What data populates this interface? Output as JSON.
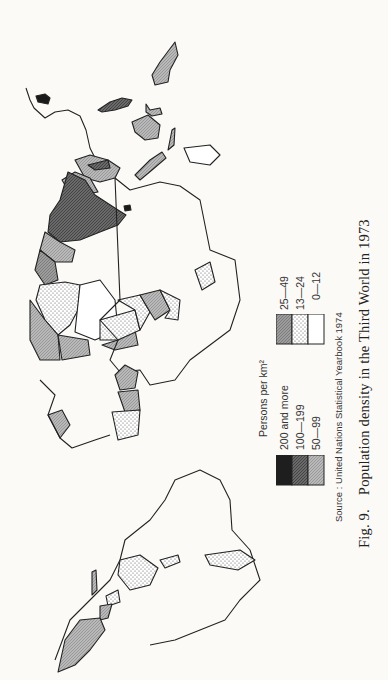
{
  "figure": {
    "number_label": "Fig. 9.",
    "title": "Population density in the Third World in 1973",
    "source": "Source : United Nations Statistical Yearbook 1974"
  },
  "legend": {
    "title": "Persons per km²",
    "items": [
      {
        "label": "200 and more",
        "pattern": "solid-black",
        "color": "#1a1a1a"
      },
      {
        "label": "100—199",
        "pattern": "dark-hatch",
        "color": "#5a5a5a"
      },
      {
        "label": "50—99",
        "pattern": "grey-hatch",
        "color": "#9a9a9a"
      },
      {
        "label": "25—49",
        "pattern": "light-hatch",
        "color": "#b8b8b8"
      },
      {
        "label": "13—24",
        "pattern": "dots",
        "color": "#ffffff"
      },
      {
        "label": "0—12",
        "pattern": "blank",
        "color": "#ffffff"
      }
    ]
  },
  "map": {
    "orientation": "rotated 90° counter-clockwise",
    "regions": [
      "Latin America",
      "Africa",
      "Middle East",
      "South Asia",
      "Southeast Asia"
    ]
  }
}
